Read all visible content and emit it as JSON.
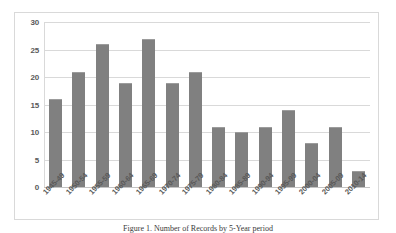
{
  "chart_data": {
    "type": "bar",
    "title": "",
    "xlabel": "",
    "ylabel": "",
    "ylim": [
      0,
      30
    ],
    "yticks": [
      0,
      5,
      10,
      15,
      20,
      25,
      30
    ],
    "grid": true,
    "legend": false,
    "bar_color": "#808080",
    "categories": [
      "1945-49",
      "1950-54",
      "1955-59",
      "1960-64",
      "1965-69",
      "1970-74",
      "1975-79",
      "1980-84",
      "1985-89",
      "1990-94",
      "1995-99",
      "2000-04",
      "2005-09",
      "2010-14"
    ],
    "values": [
      16,
      21,
      26,
      19,
      27,
      19,
      21,
      11,
      10,
      11,
      14,
      8,
      11,
      3
    ]
  },
  "caption": {
    "text": "Figure 1. Number of Records by 5-Year period"
  }
}
